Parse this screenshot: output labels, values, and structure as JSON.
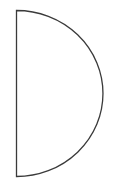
{
  "diagram": {
    "shape": "semicircle",
    "orientation": "flat-side-left",
    "stroke_color": "#3a3a3a",
    "fill_color": "#ffffff",
    "stroke_width": 1.3
  }
}
